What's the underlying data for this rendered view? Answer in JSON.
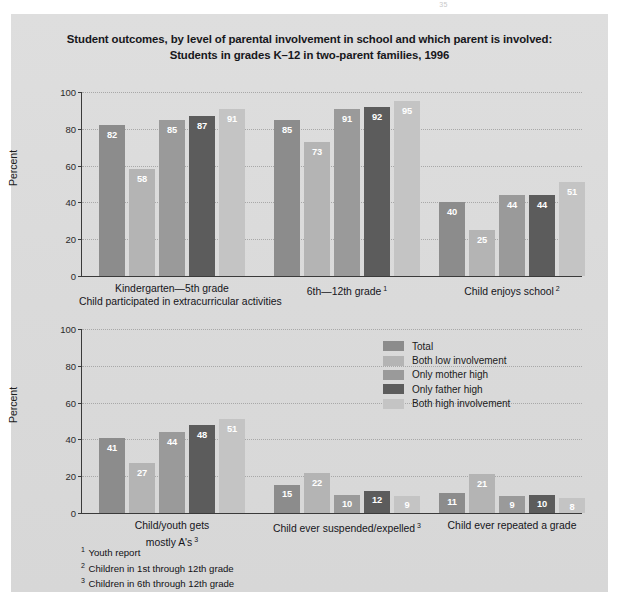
{
  "page_number": "35",
  "title": {
    "line1": "Student outcomes, by level of parental involvement in school and which parent is involved:",
    "line2": "Students in grades K–12 in two-parent families, 1996"
  },
  "legend": {
    "items": [
      {
        "label": "Total",
        "color": "#8c8c8c"
      },
      {
        "label": "Both low involvement",
        "color": "#b4b4b4"
      },
      {
        "label": "Only mother high",
        "color": "#9a9a9a"
      },
      {
        "label": "Only father high",
        "color": "#5c5c5c"
      },
      {
        "label": "Both high involvement",
        "color": "#c4c4c4"
      }
    ]
  },
  "axis": {
    "ylabel": "Percent",
    "ticks": [
      "0",
      "20",
      "40",
      "60",
      "80",
      "100"
    ],
    "ymin": 0,
    "ymax": 100
  },
  "footnotes": [
    {
      "marker": "1",
      "text": "Youth report"
    },
    {
      "marker": "2",
      "text": "Children in 1st through 12th grade"
    },
    {
      "marker": "3",
      "text": "Children in 6th through 12th grade"
    }
  ],
  "chart_data": [
    {
      "type": "bar",
      "title": "Student outcomes, by level of parental involvement in school and which parent is involved: Students in grades K–12 in two-parent families, 1996",
      "panel": "top",
      "xlabel": "",
      "ylabel": "Percent",
      "ylim": [
        0,
        100
      ],
      "grid": true,
      "legend_position": "none",
      "categories": [
        "Kindergarten—5th grade",
        "6th—12th grade",
        "Child enjoys school"
      ],
      "category_footnotes": [
        "",
        "1",
        "2"
      ],
      "group_heading": "Child participated in extracurricular activities",
      "series": [
        {
          "name": "Total",
          "color": "#8c8c8c",
          "values": [
            82,
            85,
            40
          ]
        },
        {
          "name": "Both low involvement",
          "color": "#b4b4b4",
          "values": [
            58,
            73,
            25
          ]
        },
        {
          "name": "Only mother high",
          "color": "#9a9a9a",
          "values": [
            85,
            91,
            44
          ]
        },
        {
          "name": "Only father high",
          "color": "#5c5c5c",
          "values": [
            87,
            92,
            44
          ]
        },
        {
          "name": "Both high involvement",
          "color": "#c4c4c4",
          "values": [
            91,
            95,
            51
          ]
        }
      ]
    },
    {
      "type": "bar",
      "panel": "bottom",
      "xlabel": "",
      "ylabel": "Percent",
      "ylim": [
        0,
        100
      ],
      "grid": true,
      "legend_position": "top-right",
      "categories": [
        "Child/youth gets mostly A's",
        "Child ever suspended/expelled",
        "Child ever repeated a grade"
      ],
      "category_footnotes": [
        "3",
        "3",
        ""
      ],
      "series": [
        {
          "name": "Total",
          "color": "#8c8c8c",
          "values": [
            41,
            15,
            11
          ]
        },
        {
          "name": "Both low involvement",
          "color": "#b4b4b4",
          "values": [
            27,
            22,
            21
          ]
        },
        {
          "name": "Only mother high",
          "color": "#9a9a9a",
          "values": [
            44,
            10,
            9
          ]
        },
        {
          "name": "Only father high",
          "color": "#5c5c5c",
          "values": [
            48,
            12,
            10
          ]
        },
        {
          "name": "Both high involvement",
          "color": "#c4c4c4",
          "values": [
            51,
            9,
            8
          ]
        }
      ]
    }
  ]
}
